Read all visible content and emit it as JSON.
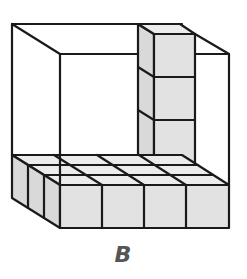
{
  "figure": {
    "label": "B",
    "colors": {
      "outline": "#1a1a1a",
      "cube_fill": "#e2e2e2",
      "label": "#555555",
      "background": "#ffffff"
    },
    "floor_layer": {
      "rows": 3,
      "cols": 4
    },
    "column": {
      "height_cubes": 4
    }
  }
}
